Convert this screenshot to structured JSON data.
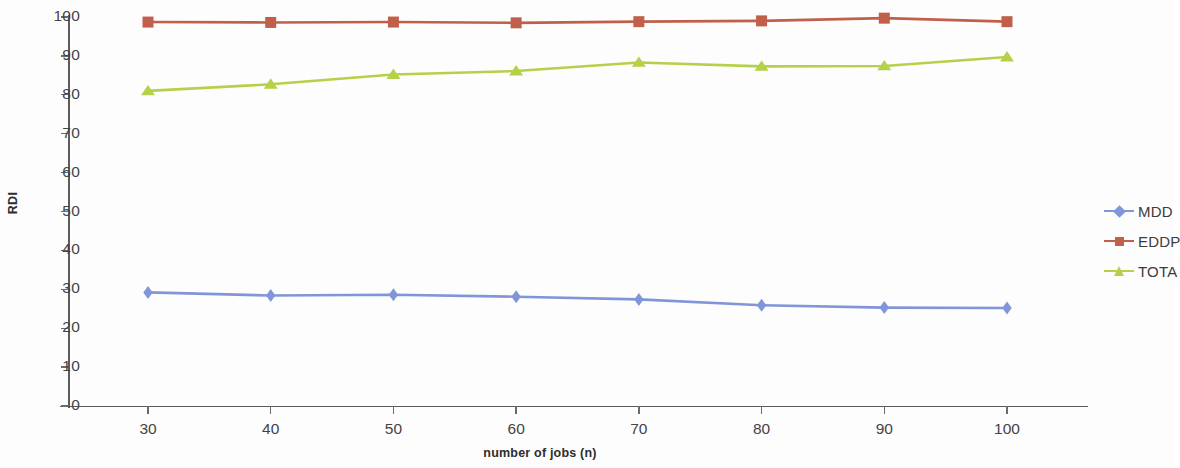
{
  "chart_data": {
    "type": "line",
    "title": "",
    "xlabel": "number of jobs (n)",
    "ylabel": "RDI",
    "categories": [
      30,
      40,
      50,
      60,
      70,
      80,
      90,
      100
    ],
    "x_tick_labels": [
      "30",
      "40",
      "50",
      "60",
      "70",
      "80",
      "90",
      "100"
    ],
    "y_tick_labels": [
      "0",
      "10",
      "20",
      "30",
      "40",
      "50",
      "60",
      "70",
      "80",
      "90",
      "100"
    ],
    "y_ticks": [
      0,
      10,
      20,
      30,
      40,
      50,
      60,
      70,
      80,
      90,
      100
    ],
    "ylim": [
      0,
      100
    ],
    "grid": false,
    "legend_position": "right",
    "series": [
      {
        "name": "MDD",
        "color": "#8196d8",
        "marker": "diamond",
        "values": [
          29.2,
          28.4,
          28.6,
          28.1,
          27.4,
          25.9,
          25.3,
          25.2
        ]
      },
      {
        "name": "EDDP",
        "color": "#c0604b",
        "marker": "square",
        "values": [
          98.7,
          98.6,
          98.7,
          98.5,
          98.8,
          99.0,
          99.7,
          98.8
        ]
      },
      {
        "name": "TOTA",
        "color": "#b5d14a",
        "marker": "triangle",
        "values": [
          81.0,
          82.7,
          85.2,
          86.1,
          88.3,
          87.3,
          87.4,
          89.7
        ]
      }
    ]
  },
  "legend": {
    "entries": [
      {
        "label": "MDD"
      },
      {
        "label": "EDDP"
      },
      {
        "label": "TOTA"
      }
    ]
  }
}
